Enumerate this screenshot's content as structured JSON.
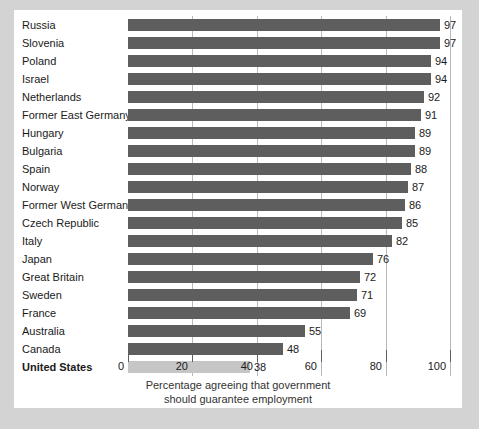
{
  "chart_data": {
    "type": "bar",
    "orientation": "horizontal",
    "title": "",
    "xlabel": "Percentage agreeing that government should guarantee employment",
    "ylabel": "",
    "xlim": [
      0,
      100
    ],
    "xticks": [
      0,
      20,
      40,
      60,
      80,
      100
    ],
    "xtick_labels": [
      "0",
      "20",
      "40",
      "60",
      "80",
      "100"
    ],
    "grid": true,
    "grid_axis": "x",
    "legend": "none",
    "categories": [
      "Russia",
      "Slovenia",
      "Poland",
      "Israel",
      "Netherlands",
      "Former East Germany",
      "Hungary",
      "Bulgaria",
      "Spain",
      "Norway",
      "Former West Germany",
      "Czech Republic",
      "Italy",
      "Japan",
      "Great Britain",
      "Sweden",
      "France",
      "Australia",
      "Canada",
      "United States"
    ],
    "values": [
      97,
      97,
      94,
      94,
      92,
      91,
      89,
      89,
      88,
      87,
      86,
      85,
      82,
      76,
      72,
      71,
      69,
      55,
      48,
      38
    ],
    "value_labels": [
      "97",
      "97",
      "94",
      "94",
      "92",
      "91",
      "89",
      "89",
      "88",
      "87",
      "86",
      "85",
      "82",
      "76",
      "72",
      "71",
      "69",
      "55",
      "48",
      "38"
    ],
    "highlighted_category": "United States",
    "bar_color": "#5e5e5e",
    "highlight_bar_color": "#c6c6c6",
    "panel_background": "#ffffff",
    "page_background": "#d3d3d3",
    "gridline_color": "#b9b9b9"
  },
  "caption": {
    "line1": "Percentage agreeing that government",
    "line2": "should guarantee employment"
  }
}
